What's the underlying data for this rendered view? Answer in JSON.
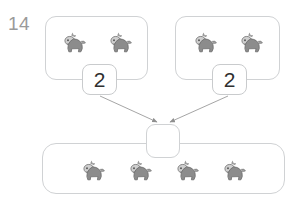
{
  "question": {
    "number": "14",
    "type": "part-part-whole addition with picture tokens"
  },
  "token": {
    "icon": "horse-icon",
    "color_body": "#8c8c8c",
    "color_outline": "#6f6f6f",
    "color_head": "#bdbdbd"
  },
  "parts": [
    {
      "name": "left",
      "count_label": "2",
      "tokens": [
        "horse-icon",
        "horse-icon"
      ]
    },
    {
      "name": "right",
      "count_label": "2",
      "tokens": [
        "horse-icon",
        "horse-icon"
      ]
    }
  ],
  "whole": {
    "answer_value": "",
    "tokens": [
      "horse-icon",
      "horse-icon",
      "horse-icon",
      "horse-icon"
    ]
  },
  "colors": {
    "background": "#ffffff",
    "box_border": "#d0d2d4",
    "chip_border": "#c9cbcd",
    "arrow": "#9b9b9b",
    "number_text": "#2f2f2f",
    "question_number_text": "#9a9a9a"
  }
}
